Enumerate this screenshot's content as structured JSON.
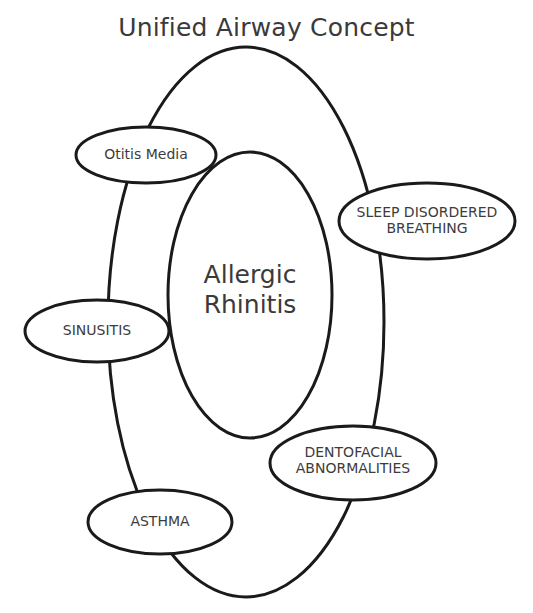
{
  "title": "Unified Airway Concept",
  "center": {
    "line1": "Allergic",
    "line2": "Rhinitis"
  },
  "nodes": [
    {
      "id": "otitis-media",
      "line1": "Otitis Media",
      "line2": ""
    },
    {
      "id": "sleep-disordered-breathing",
      "line1": "SLEEP DISORDERED",
      "line2": "BREATHING"
    },
    {
      "id": "sinusitis",
      "line1": "SINUSITIS",
      "line2": ""
    },
    {
      "id": "dentofacial-abnormalities",
      "line1": "DENTOFACIAL",
      "line2": "ABNORMALITIES"
    },
    {
      "id": "asthma",
      "line1": "ASTHMA",
      "line2": ""
    }
  ],
  "colors": {
    "stroke": "#1a1a1a",
    "text": "#3c3c3c",
    "background": "#ffffff"
  }
}
